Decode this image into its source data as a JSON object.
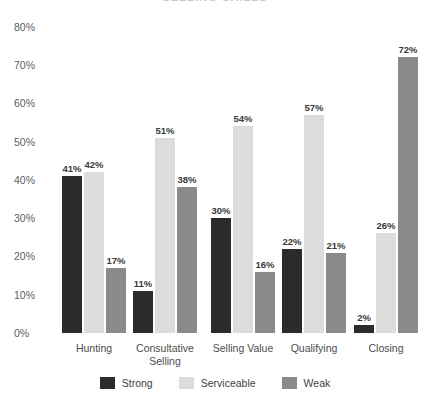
{
  "chart_data": {
    "type": "bar",
    "title": "SELLING SKILLS",
    "xlabel": "",
    "ylabel": "",
    "ylim": [
      0,
      80
    ],
    "ytick_labels": [
      "0%",
      "10%",
      "20%",
      "30%",
      "40%",
      "50%",
      "60%",
      "70%",
      "80%"
    ],
    "ytick_values": [
      0,
      10,
      20,
      30,
      40,
      50,
      60,
      70,
      80
    ],
    "grid": false,
    "legend_position": "bottom",
    "value_suffix": "%",
    "categories": [
      "Hunting",
      "Consultative Selling",
      "Selling Value",
      "Qualifying",
      "Closing"
    ],
    "series": [
      {
        "name": "Strong",
        "color": "#2b2b2b",
        "values": [
          41,
          11,
          30,
          22,
          2
        ],
        "labels": [
          "41%",
          "11%",
          "30%",
          "22%",
          "2%"
        ]
      },
      {
        "name": "Serviceable",
        "color": "#dcdcdc",
        "values": [
          42,
          51,
          54,
          57,
          26
        ],
        "labels": [
          "42%",
          "51%",
          "54%",
          "57%",
          "26%"
        ]
      },
      {
        "name": "Weak",
        "color": "#8a8a8a",
        "values": [
          17,
          38,
          16,
          21,
          72
        ],
        "labels": [
          "17%",
          "38%",
          "16%",
          "21%",
          "72%"
        ]
      }
    ]
  }
}
